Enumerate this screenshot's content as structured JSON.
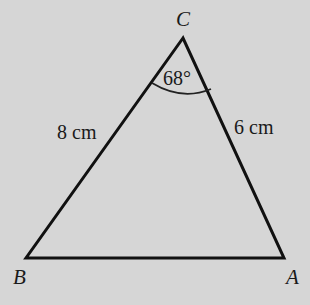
{
  "diagram": {
    "type": "triangle",
    "vertices": {
      "A": {
        "label": "A"
      },
      "B": {
        "label": "B"
      },
      "C": {
        "label": "C"
      }
    },
    "sides": {
      "CB": {
        "label": "8 cm"
      },
      "CA": {
        "label": "6 cm"
      }
    },
    "angle_C": {
      "label": "68°"
    },
    "colors": {
      "background": "#d6d6d6",
      "stroke": "#111111"
    }
  }
}
